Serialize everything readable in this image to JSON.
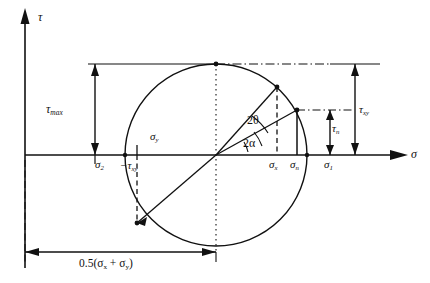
{
  "figure": {
    "type": "mohrs-circle-diagram",
    "axes": {
      "vertical_label": "τ",
      "horizontal_label": "σ",
      "origin_px": [
        25,
        155
      ]
    },
    "circle": {
      "center_px": [
        216,
        155
      ],
      "radius_px": 91,
      "center_value_label": "0.5(σ",
      "center_value_label_sub1": "x",
      "center_value_label_mid": " + σ",
      "center_value_label_sub2": "y",
      "center_value_label_end": ")"
    },
    "labels": {
      "tau_axis": "τ",
      "sigma_axis": "σ",
      "tau_max": "τ",
      "tau_max_sub": "max",
      "sigma_2": "σ",
      "sigma_2_sub": "2",
      "sigma_1": "σ",
      "sigma_1_sub": "1",
      "sigma_x": "σ",
      "sigma_x_sub": "x",
      "sigma_y": "σ",
      "sigma_y_sub": "y",
      "sigma_n": "σ",
      "sigma_n_sub": "n",
      "tau_xy": "τ",
      "tau_xy_sub": "xy",
      "tau_n": "τ",
      "tau_n_sub": "n",
      "neg_tau_xy": "−τ",
      "neg_tau_xy_sub": "xy",
      "angle_two_theta": "2θ",
      "angle_two_alpha": "2α",
      "base_dimension": "0.5(σ",
      "base_dimension_sub1": "x",
      "base_dimension_mid": " + σ",
      "base_dimension_sub2": "y",
      "base_dimension_end": ")"
    },
    "points": {
      "sigma_x_point_px": [
        277,
        87
      ],
      "sigma_n_point_px": [
        297,
        110
      ],
      "sigma_y_point_px": [
        137,
        223
      ],
      "top_point_px": [
        216,
        64
      ],
      "sigma_2_px": [
        125,
        155
      ],
      "sigma_1_px": [
        307,
        155
      ]
    },
    "colors": {
      "stroke": "#111111",
      "background": "#ffffff"
    }
  }
}
